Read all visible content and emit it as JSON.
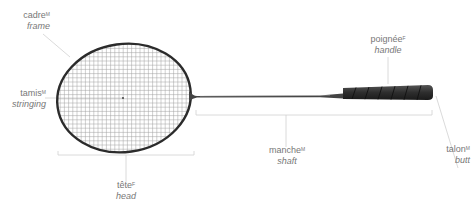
{
  "labels": {
    "frame": {
      "fr": "cadre",
      "gender": "M",
      "en": "frame"
    },
    "stringing": {
      "fr": "tamis",
      "gender": "M",
      "en": "stringing"
    },
    "handle": {
      "fr": "poignée",
      "gender": "F",
      "en": "handle"
    },
    "shaft": {
      "fr": "manche",
      "gender": "M",
      "en": "shaft"
    },
    "butt": {
      "fr": "talon",
      "gender": "M",
      "en": "butt"
    },
    "head": {
      "fr": "tête",
      "gender": "F",
      "en": "head"
    }
  },
  "colors": {
    "frame": "#2b2b2b",
    "strings": "#9a9a9a",
    "grip": "#3a3a3a",
    "leader": "#cfcfcf",
    "text": "#777777"
  }
}
